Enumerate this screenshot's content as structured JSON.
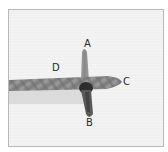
{
  "figure": {
    "labels": [
      {
        "id": "A",
        "text": "A"
      },
      {
        "id": "B",
        "text": "B"
      },
      {
        "id": "C",
        "text": "C"
      },
      {
        "id": "D",
        "text": "D"
      }
    ],
    "colors": {
      "yarn": "#8a8a8a",
      "yarn_dark": "#3a3a3a",
      "background": "#f2f2f2",
      "frame_border": "#b8b8b8"
    }
  }
}
